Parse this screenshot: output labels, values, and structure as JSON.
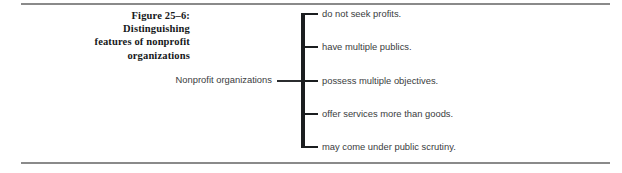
{
  "figure": {
    "caption_lines": [
      "Figure 25–6:",
      "Distinguishing",
      "features of nonprofit",
      "organizations"
    ],
    "root_label": "Nonprofit organizations",
    "branches": [
      "do not seek profits.",
      "have multiple publics.",
      "possess multiple objectives.",
      "offer services more than goods.",
      "may come under public scrutiny."
    ],
    "colors": {
      "rule": "#8a8a8a",
      "bracket": "#1b1d1f",
      "caption_text": "#16181a",
      "branch_text": "#3a3c3e",
      "background": "#ffffff"
    }
  }
}
